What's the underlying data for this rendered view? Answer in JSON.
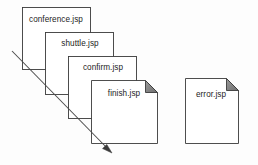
{
  "diagram": {
    "type": "page-stack-flow",
    "background_color": "#fdfdfd",
    "stroke_color": "#3a3a3a",
    "fold_color": "#808080",
    "arrow_color": "#3a3a3a",
    "stack": {
      "name": "jsp-page-stack",
      "pages": [
        {
          "id": "conference",
          "label": "conference.jsp",
          "x": 22,
          "y": 7,
          "width": 68,
          "height": 62,
          "fold": false,
          "label_x": 54,
          "label_y": 20
        },
        {
          "id": "shuttle",
          "label": "shuttle.jsp",
          "x": 45,
          "y": 32,
          "width": 68,
          "height": 62,
          "fold": false,
          "label_x": 80,
          "label_y": 44
        },
        {
          "id": "confirm",
          "label": "confirm.jsp",
          "x": 68,
          "y": 56,
          "width": 68,
          "height": 62,
          "fold": false,
          "label_x": 103,
          "label_y": 68
        },
        {
          "id": "finish",
          "label": "finish.jsp",
          "x": 91,
          "y": 80,
          "width": 66,
          "height": 63,
          "fold": true,
          "fold_size": 12,
          "label_x": 124,
          "label_y": 94
        }
      ]
    },
    "standalone": {
      "name": "error-page",
      "pages": [
        {
          "id": "error",
          "label": "error.jsp",
          "x": 185,
          "y": 78,
          "width": 53,
          "height": 65,
          "fold": true,
          "fold_size": 12,
          "label_x": 211,
          "label_y": 95
        }
      ]
    },
    "arrow": {
      "name": "flow-direction-arrow",
      "x1": 12,
      "y1": 51,
      "x2": 111,
      "y2": 152,
      "head_points": "111,152 103.5,146.5 105.8,143.3"
    }
  }
}
